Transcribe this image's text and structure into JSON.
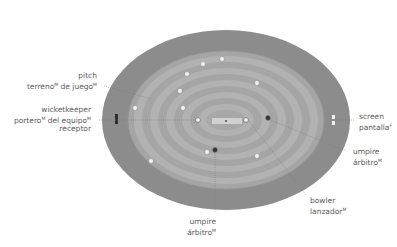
{
  "colors": {
    "outer_field": "#8a8a8a",
    "inner_field_dark": "#a3a3a3",
    "inner_field_light": "#b4b4b4",
    "pitch": "#cfcfcf",
    "fielder": "#f2f2f2",
    "umpire": "#3a3a3a",
    "leader_line": "#7a7a7a",
    "text": "#5a5a5a"
  },
  "labels": {
    "pitch": {
      "en": "pitch",
      "es": "terreno",
      "es_gender": "M",
      "es_suffix": "de juego",
      "es_suffix_gender": "M"
    },
    "wicketkeeper": {
      "en": "wicketkeeper",
      "es1": "portero",
      "es1_gender": "M",
      "es1_suffix": "del equipo",
      "es1_suffix_gender": "M",
      "es2": "receptor"
    },
    "screen": {
      "en": "screen",
      "es": "pantalla",
      "es_gender": "F"
    },
    "umpire_right": {
      "en": "umpire",
      "es": "árbitro",
      "es_gender": "M"
    },
    "bowler": {
      "en": "bowler",
      "es": "lanzador",
      "es_gender": "M"
    },
    "umpire_bottom": {
      "en": "umpire",
      "es": "árbitro",
      "es_gender": "M"
    }
  }
}
